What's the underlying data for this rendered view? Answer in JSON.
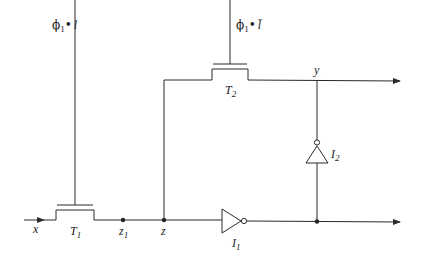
{
  "diagram": {
    "type": "circuit-schematic",
    "clock_labels": {
      "t1_gate": {
        "phi": "ϕ",
        "phi_sub": "1",
        "dot": "•",
        "var": "l"
      },
      "t2_gate": {
        "phi": "ϕ",
        "phi_sub": "1",
        "dot": "•",
        "var": "l̄"
      }
    },
    "transistors": [
      {
        "id": "T1",
        "name": "T",
        "sub": "1"
      },
      {
        "id": "T2",
        "name": "T",
        "sub": "2"
      }
    ],
    "inverters": [
      {
        "id": "I1",
        "name": "I",
        "sub": "1"
      },
      {
        "id": "I2",
        "name": "I",
        "sub": "2"
      }
    ],
    "nodes": {
      "x": "x",
      "z1": {
        "name": "z",
        "sub": "1"
      },
      "z": "z",
      "y": "y"
    },
    "colors": {
      "wire": "#2a2a2a",
      "background": "#ffffff"
    }
  }
}
